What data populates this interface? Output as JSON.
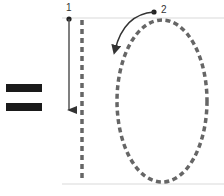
{
  "diagram": {
    "symbol": "=",
    "steps": [
      {
        "number": "1",
        "description": "straight dashed vertical stroke, drawn top to bottom"
      },
      {
        "number": "2",
        "description": "dashed oval stroke, drawn counter-clockwise starting at top"
      }
    ],
    "colors": {
      "equals": "#1a1a1a",
      "dashed_stroke": "#666666",
      "arrow": "#333333",
      "guide_line": "#e6e6e6"
    }
  }
}
